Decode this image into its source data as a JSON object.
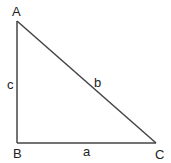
{
  "diagram": {
    "type": "right-triangle",
    "vertices": [
      {
        "id": "A",
        "label": "A",
        "x": 17,
        "y": 21
      },
      {
        "id": "B",
        "label": "B",
        "x": 17,
        "y": 143
      },
      {
        "id": "C",
        "label": "C",
        "x": 156,
        "y": 143
      }
    ],
    "sides": [
      {
        "id": "c",
        "label": "c",
        "from": "A",
        "to": "B"
      },
      {
        "id": "a",
        "label": "a",
        "from": "B",
        "to": "C"
      },
      {
        "id": "b",
        "label": "b",
        "from": "A",
        "to": "C"
      }
    ],
    "right_angle_at": "B",
    "line_color": "#444444"
  }
}
